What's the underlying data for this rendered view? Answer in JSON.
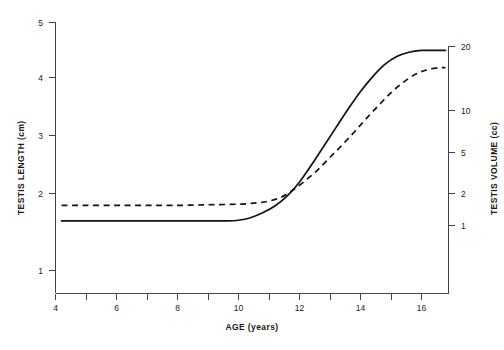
{
  "chart_data": {
    "type": "line",
    "title": "",
    "xlabel": "AGE (years)",
    "ylabel": "TESTIS LENGTH (cm)",
    "y2label": "TESTIS VOLUME (cc)",
    "xlim": [
      4,
      16.9
    ],
    "ylim": [
      0.55,
      5.0
    ],
    "y2_scale": "log",
    "y2lim": [
      1,
      20
    ],
    "grid": false,
    "legend": null,
    "xticks": [
      4,
      5,
      6,
      7,
      8,
      9,
      10,
      11,
      12,
      13,
      14,
      15,
      16,
      17
    ],
    "xticklabels": [
      "4",
      "",
      "6",
      "",
      "8",
      "",
      "10",
      "",
      "12",
      "",
      "14",
      "",
      "16",
      ""
    ],
    "xticklabels_shown": [
      "4",
      "6",
      "8",
      "10",
      "12",
      "14",
      "16"
    ],
    "yticks": [
      1,
      2,
      3,
      4,
      5
    ],
    "yticklabels": [
      "1",
      "2",
      "3",
      "4",
      "5"
    ],
    "y2ticks": [
      1,
      2,
      5,
      10,
      20
    ],
    "y2ticklabels": [
      "1",
      "2",
      "5",
      "10",
      "20"
    ],
    "series": [
      {
        "name": "solid-curve",
        "style": "solid",
        "color": "#111111",
        "x": [
          4.2,
          5.0,
          6.0,
          7.0,
          8.0,
          9.0,
          9.6,
          10.0,
          10.4,
          10.8,
          11.2,
          11.6,
          12.0,
          12.4,
          12.8,
          13.2,
          13.6,
          14.0,
          14.4,
          14.8,
          15.2,
          15.6,
          16.0,
          16.4,
          16.8
        ],
        "y": [
          1.8,
          1.8,
          1.8,
          1.8,
          1.8,
          1.8,
          1.8,
          1.81,
          1.85,
          1.93,
          2.04,
          2.2,
          2.42,
          2.7,
          3.0,
          3.3,
          3.6,
          3.88,
          4.12,
          4.32,
          4.45,
          4.52,
          4.55,
          4.55,
          4.55
        ]
      },
      {
        "name": "dashed-curve",
        "style": "dashed",
        "color": "#111111",
        "x": [
          4.2,
          5.0,
          6.0,
          7.0,
          8.0,
          9.0,
          10.0,
          10.6,
          11.0,
          11.4,
          11.8,
          12.2,
          12.6,
          13.0,
          13.4,
          13.8,
          14.2,
          14.6,
          15.0,
          15.4,
          15.8,
          16.2,
          16.6,
          16.8
        ],
        "y": [
          2.05,
          2.05,
          2.05,
          2.05,
          2.05,
          2.06,
          2.07,
          2.09,
          2.12,
          2.18,
          2.3,
          2.45,
          2.62,
          2.82,
          3.02,
          3.23,
          3.45,
          3.66,
          3.86,
          4.03,
          4.16,
          4.24,
          4.27,
          4.27
        ]
      }
    ],
    "annotations": [
      {
        "text": "Curves cross near age 11.5 at about 2.15 cm",
        "visible": false
      }
    ]
  },
  "axes": {
    "left_title": "TESTIS LENGTH (cm)",
    "right_title": "TESTIS VOLUME (cc)",
    "bottom_title": "AGE (years)"
  },
  "caption": {
    "text": ""
  }
}
